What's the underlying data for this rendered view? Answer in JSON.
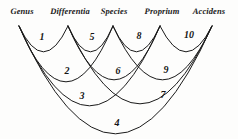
{
  "figure": {
    "kind": "predicables-arc-diagram",
    "stroke_color": "#1a1a1a",
    "label_color": "#1b1b1b",
    "background_color": "#fdfdfc"
  },
  "nodes": [
    {
      "id": "genus",
      "label": "Genus",
      "x": 19,
      "y": 26,
      "label_x": 22,
      "label_y": 6
    },
    {
      "id": "differentia",
      "label": "Differentia",
      "x": 68,
      "y": 26,
      "label_x": 70,
      "label_y": 6
    },
    {
      "id": "species",
      "label": "Species",
      "x": 113,
      "y": 26,
      "label_x": 114,
      "label_y": 6
    },
    {
      "id": "proprium",
      "label": "Proprium",
      "x": 160,
      "y": 26,
      "label_x": 162,
      "label_y": 6
    },
    {
      "id": "accidens",
      "label": "Accidens",
      "x": 212,
      "y": 26,
      "label_x": 209,
      "label_y": 6
    }
  ],
  "arcs": [
    {
      "number": "1",
      "from": "genus",
      "to": "differentia",
      "depth": 26,
      "num_x": 42,
      "num_y": 36
    },
    {
      "number": "2",
      "from": "genus",
      "to": "species",
      "depth": 56,
      "num_x": 67,
      "num_y": 70
    },
    {
      "number": "3",
      "from": "genus",
      "to": "proprium",
      "depth": 80,
      "num_x": 82,
      "num_y": 95
    },
    {
      "number": "4",
      "from": "genus",
      "to": "accidens",
      "depth": 108,
      "num_x": 117,
      "num_y": 122
    },
    {
      "number": "5",
      "from": "differentia",
      "to": "species",
      "depth": 26,
      "num_x": 92,
      "num_y": 36
    },
    {
      "number": "6",
      "from": "differentia",
      "to": "proprium",
      "depth": 54,
      "num_x": 118,
      "num_y": 70
    },
    {
      "number": "7",
      "from": "differentia",
      "to": "accidens",
      "depth": 78,
      "num_x": 163,
      "num_y": 94
    },
    {
      "number": "8",
      "from": "species",
      "to": "proprium",
      "depth": 26,
      "num_x": 139,
      "num_y": 35
    },
    {
      "number": "9",
      "from": "species",
      "to": "accidens",
      "depth": 54,
      "num_x": 166,
      "num_y": 69
    },
    {
      "number": "10",
      "from": "proprium",
      "to": "accidens",
      "depth": 26,
      "num_x": 189,
      "num_y": 34
    }
  ]
}
